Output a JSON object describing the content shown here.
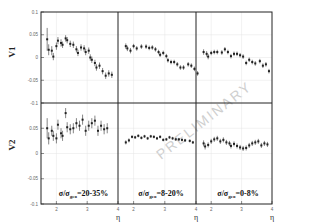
{
  "chart_data": {
    "type": "scatter",
    "title": "",
    "layout": "2 rows x 3 columns, shared axes",
    "row_labels": [
      "V1",
      "V2"
    ],
    "xlabel": "η",
    "x_ticks": [
      2,
      3,
      4
    ],
    "xlim": [
      1.5,
      4.0
    ],
    "ylim": [
      -0.1,
      0.1
    ],
    "y_ticks": [
      0.1,
      0.05,
      0,
      -0.05,
      -0.1
    ],
    "y_tick_labels": [
      "0.1",
      "0.05",
      "0",
      "-0.05",
      "-0.1"
    ],
    "grid": true,
    "watermark": "PRELIMINARY",
    "columns": [
      {
        "label_main": "σ/σ",
        "label_sub": "geo",
        "label_range": "=20-35%"
      },
      {
        "label_main": "σ/σ",
        "label_sub": "geo",
        "label_range": "=8-20%"
      },
      {
        "label_main": "σ/σ",
        "label_sub": "geo",
        "label_range": "=0-8%"
      }
    ],
    "panels": [
      {
        "row": "V1",
        "col": 0,
        "series": [
          {
            "x": 1.7,
            "y": 0.04,
            "e": 0.025
          },
          {
            "x": 1.75,
            "y": 0.017,
            "e": 0.012
          },
          {
            "x": 1.85,
            "y": 0.015,
            "e": 0.01
          },
          {
            "x": 1.9,
            "y": 0.002,
            "e": 0.008
          },
          {
            "x": 2.0,
            "y": 0.025,
            "e": 0.008
          },
          {
            "x": 2.05,
            "y": 0.037,
            "e": 0.008
          },
          {
            "x": 2.15,
            "y": 0.032,
            "e": 0.008
          },
          {
            "x": 2.2,
            "y": 0.028,
            "e": 0.007
          },
          {
            "x": 2.3,
            "y": 0.042,
            "e": 0.007
          },
          {
            "x": 2.35,
            "y": 0.038,
            "e": 0.007
          },
          {
            "x": 2.45,
            "y": 0.03,
            "e": 0.007
          },
          {
            "x": 2.55,
            "y": 0.028,
            "e": 0.007
          },
          {
            "x": 2.65,
            "y": 0.018,
            "e": 0.007
          },
          {
            "x": 2.7,
            "y": 0.01,
            "e": 0.007
          },
          {
            "x": 2.8,
            "y": 0.022,
            "e": 0.007
          },
          {
            "x": 2.9,
            "y": 0.02,
            "e": 0.007
          },
          {
            "x": 2.95,
            "y": 0.012,
            "e": 0.007
          },
          {
            "x": 3.05,
            "y": 0.015,
            "e": 0.007
          },
          {
            "x": 3.1,
            "y": 0.0,
            "e": 0.007
          },
          {
            "x": 3.15,
            "y": -0.005,
            "e": 0.007
          },
          {
            "x": 3.25,
            "y": -0.012,
            "e": 0.007
          },
          {
            "x": 3.3,
            "y": -0.022,
            "e": 0.007
          },
          {
            "x": 3.4,
            "y": -0.018,
            "e": 0.007
          },
          {
            "x": 3.5,
            "y": -0.03,
            "e": 0.007
          },
          {
            "x": 3.6,
            "y": -0.04,
            "e": 0.007
          },
          {
            "x": 3.7,
            "y": -0.035,
            "e": 0.007
          },
          {
            "x": 3.8,
            "y": -0.038,
            "e": 0.007
          }
        ]
      },
      {
        "row": "V1",
        "col": 1,
        "series": [
          {
            "x": 1.75,
            "y": 0.025,
            "e": 0.006
          },
          {
            "x": 1.8,
            "y": 0.02,
            "e": 0.006
          },
          {
            "x": 1.9,
            "y": 0.015,
            "e": 0.006
          },
          {
            "x": 2.0,
            "y": 0.025,
            "e": 0.005
          },
          {
            "x": 2.1,
            "y": 0.02,
            "e": 0.005
          },
          {
            "x": 2.25,
            "y": 0.024,
            "e": 0.005
          },
          {
            "x": 2.4,
            "y": 0.024,
            "e": 0.005
          },
          {
            "x": 2.5,
            "y": 0.021,
            "e": 0.005
          },
          {
            "x": 2.6,
            "y": 0.022,
            "e": 0.005
          },
          {
            "x": 2.7,
            "y": 0.018,
            "e": 0.005
          },
          {
            "x": 2.8,
            "y": 0.012,
            "e": 0.005
          },
          {
            "x": 2.85,
            "y": 0.006,
            "e": 0.005
          },
          {
            "x": 2.95,
            "y": 0.01,
            "e": 0.005
          },
          {
            "x": 3.05,
            "y": 0.003,
            "e": 0.005
          },
          {
            "x": 3.1,
            "y": -0.006,
            "e": 0.005
          },
          {
            "x": 3.2,
            "y": -0.01,
            "e": 0.005
          },
          {
            "x": 3.3,
            "y": -0.01,
            "e": 0.005
          },
          {
            "x": 3.4,
            "y": -0.015,
            "e": 0.005
          },
          {
            "x": 3.5,
            "y": -0.022,
            "e": 0.005
          },
          {
            "x": 3.6,
            "y": -0.022,
            "e": 0.005
          },
          {
            "x": 3.75,
            "y": -0.015,
            "e": 0.005
          },
          {
            "x": 3.85,
            "y": -0.018,
            "e": 0.005
          },
          {
            "x": 3.95,
            "y": -0.025,
            "e": 0.005
          },
          {
            "x": 4.05,
            "y": -0.035,
            "e": 0.005
          }
        ]
      },
      {
        "row": "V1",
        "col": 2,
        "series": [
          {
            "x": 1.75,
            "y": 0.012,
            "e": 0.006
          },
          {
            "x": 1.85,
            "y": 0.008,
            "e": 0.006
          },
          {
            "x": 1.9,
            "y": 0.002,
            "e": 0.006
          },
          {
            "x": 2.0,
            "y": 0.01,
            "e": 0.005
          },
          {
            "x": 2.1,
            "y": 0.012,
            "e": 0.005
          },
          {
            "x": 2.2,
            "y": 0.012,
            "e": 0.005
          },
          {
            "x": 2.35,
            "y": 0.011,
            "e": 0.005
          },
          {
            "x": 2.45,
            "y": 0.018,
            "e": 0.005
          },
          {
            "x": 2.55,
            "y": 0.012,
            "e": 0.005
          },
          {
            "x": 2.65,
            "y": 0.003,
            "e": 0.005
          },
          {
            "x": 2.75,
            "y": 0.008,
            "e": 0.005
          },
          {
            "x": 2.85,
            "y": 0.008,
            "e": 0.005
          },
          {
            "x": 2.95,
            "y": 0.005,
            "e": 0.005
          },
          {
            "x": 3.05,
            "y": 0.002,
            "e": 0.005
          },
          {
            "x": 3.15,
            "y": -0.012,
            "e": 0.005
          },
          {
            "x": 3.25,
            "y": -0.005,
            "e": 0.005
          },
          {
            "x": 3.35,
            "y": -0.01,
            "e": 0.005
          },
          {
            "x": 3.45,
            "y": -0.013,
            "e": 0.005
          },
          {
            "x": 3.6,
            "y": -0.008,
            "e": 0.005
          },
          {
            "x": 3.7,
            "y": -0.018,
            "e": 0.005
          },
          {
            "x": 3.8,
            "y": -0.015,
            "e": 0.005
          },
          {
            "x": 3.9,
            "y": -0.03,
            "e": 0.005
          }
        ]
      },
      {
        "row": "V2",
        "col": 0,
        "series": [
          {
            "x": 1.7,
            "y": 0.05,
            "e": 0.02
          },
          {
            "x": 1.75,
            "y": 0.03,
            "e": 0.012
          },
          {
            "x": 1.85,
            "y": 0.045,
            "e": 0.01
          },
          {
            "x": 1.9,
            "y": 0.035,
            "e": 0.01
          },
          {
            "x": 2.0,
            "y": 0.03,
            "e": 0.01
          },
          {
            "x": 2.05,
            "y": 0.057,
            "e": 0.01
          },
          {
            "x": 2.15,
            "y": 0.04,
            "e": 0.01
          },
          {
            "x": 2.2,
            "y": 0.035,
            "e": 0.01
          },
          {
            "x": 2.3,
            "y": 0.08,
            "e": 0.01
          },
          {
            "x": 2.35,
            "y": 0.052,
            "e": 0.01
          },
          {
            "x": 2.45,
            "y": 0.048,
            "e": 0.01
          },
          {
            "x": 2.55,
            "y": 0.05,
            "e": 0.01
          },
          {
            "x": 2.65,
            "y": 0.06,
            "e": 0.01
          },
          {
            "x": 2.75,
            "y": 0.055,
            "e": 0.01
          },
          {
            "x": 2.85,
            "y": 0.067,
            "e": 0.01
          },
          {
            "x": 2.95,
            "y": 0.045,
            "e": 0.01
          },
          {
            "x": 3.05,
            "y": 0.055,
            "e": 0.01
          },
          {
            "x": 3.15,
            "y": 0.06,
            "e": 0.01
          },
          {
            "x": 3.25,
            "y": 0.065,
            "e": 0.01
          },
          {
            "x": 3.35,
            "y": 0.045,
            "e": 0.01
          },
          {
            "x": 3.45,
            "y": 0.055,
            "e": 0.01
          },
          {
            "x": 3.55,
            "y": 0.048,
            "e": 0.01
          },
          {
            "x": 3.65,
            "y": 0.05,
            "e": 0.01
          }
        ]
      },
      {
        "row": "V2",
        "col": 1,
        "series": [
          {
            "x": 1.75,
            "y": 0.022,
            "e": 0.004
          },
          {
            "x": 1.85,
            "y": 0.026,
            "e": 0.004
          },
          {
            "x": 1.95,
            "y": 0.033,
            "e": 0.003
          },
          {
            "x": 2.05,
            "y": 0.032,
            "e": 0.003
          },
          {
            "x": 2.15,
            "y": 0.035,
            "e": 0.003
          },
          {
            "x": 2.25,
            "y": 0.031,
            "e": 0.003
          },
          {
            "x": 2.35,
            "y": 0.034,
            "e": 0.003
          },
          {
            "x": 2.45,
            "y": 0.03,
            "e": 0.003
          },
          {
            "x": 2.55,
            "y": 0.034,
            "e": 0.003
          },
          {
            "x": 2.65,
            "y": 0.033,
            "e": 0.003
          },
          {
            "x": 2.75,
            "y": 0.03,
            "e": 0.003
          },
          {
            "x": 2.85,
            "y": 0.033,
            "e": 0.003
          },
          {
            "x": 2.95,
            "y": 0.027,
            "e": 0.003
          },
          {
            "x": 3.05,
            "y": 0.028,
            "e": 0.003
          },
          {
            "x": 3.15,
            "y": 0.032,
            "e": 0.003
          },
          {
            "x": 3.25,
            "y": 0.03,
            "e": 0.003
          },
          {
            "x": 3.35,
            "y": 0.028,
            "e": 0.003
          },
          {
            "x": 3.45,
            "y": 0.028,
            "e": 0.003
          },
          {
            "x": 3.55,
            "y": 0.027,
            "e": 0.003
          },
          {
            "x": 3.65,
            "y": 0.026,
            "e": 0.003
          },
          {
            "x": 3.8,
            "y": 0.025,
            "e": 0.003
          },
          {
            "x": 3.9,
            "y": 0.022,
            "e": 0.003
          }
        ]
      },
      {
        "row": "V2",
        "col": 2,
        "series": [
          {
            "x": 1.75,
            "y": 0.02,
            "e": 0.006
          },
          {
            "x": 1.8,
            "y": 0.014,
            "e": 0.006
          },
          {
            "x": 1.9,
            "y": 0.017,
            "e": 0.005
          },
          {
            "x": 2.0,
            "y": 0.024,
            "e": 0.005
          },
          {
            "x": 2.1,
            "y": 0.028,
            "e": 0.005
          },
          {
            "x": 2.2,
            "y": 0.03,
            "e": 0.005
          },
          {
            "x": 2.3,
            "y": 0.024,
            "e": 0.005
          },
          {
            "x": 2.4,
            "y": 0.027,
            "e": 0.005
          },
          {
            "x": 2.5,
            "y": 0.022,
            "e": 0.005
          },
          {
            "x": 2.6,
            "y": 0.02,
            "e": 0.005
          },
          {
            "x": 2.65,
            "y": 0.015,
            "e": 0.005
          },
          {
            "x": 2.75,
            "y": 0.019,
            "e": 0.005
          },
          {
            "x": 2.85,
            "y": 0.015,
            "e": 0.005
          },
          {
            "x": 2.95,
            "y": 0.012,
            "e": 0.005
          },
          {
            "x": 3.05,
            "y": 0.01,
            "e": 0.005
          },
          {
            "x": 3.15,
            "y": 0.011,
            "e": 0.005
          },
          {
            "x": 3.25,
            "y": 0.016,
            "e": 0.005
          },
          {
            "x": 3.35,
            "y": 0.02,
            "e": 0.005
          },
          {
            "x": 3.45,
            "y": 0.022,
            "e": 0.005
          },
          {
            "x": 3.55,
            "y": 0.024,
            "e": 0.005
          },
          {
            "x": 3.65,
            "y": 0.016,
            "e": 0.005
          },
          {
            "x": 3.75,
            "y": 0.02,
            "e": 0.005
          },
          {
            "x": 3.85,
            "y": 0.018,
            "e": 0.005
          }
        ]
      }
    ]
  }
}
